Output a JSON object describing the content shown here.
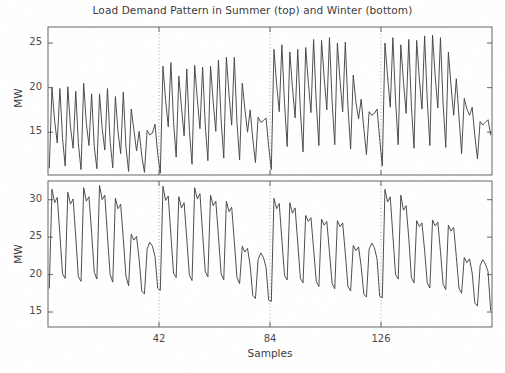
{
  "chart_data": {
    "type": "line",
    "title": "Load Demand Pattern in Summer (top) and Winter (bottom)",
    "xlabel": "Samples",
    "subplots": [
      {
        "name": "summer",
        "ylabel": "MW",
        "yticks": [
          15,
          20,
          25
        ],
        "ylim": [
          10.2,
          26.8
        ],
        "xlim": [
          0,
          168
        ],
        "xticks": [
          42,
          84,
          126
        ],
        "grid": false,
        "vlines": [
          42,
          84,
          126
        ],
        "line_color": "#444444",
        "values": [
          11.0,
          20.0,
          16.3,
          13.8,
          19.9,
          14.3,
          11.2,
          20.1,
          15.6,
          13.2,
          19.6,
          13.7,
          10.8,
          20.5,
          16.0,
          13.5,
          19.3,
          13.4,
          10.9,
          19.3,
          15.4,
          13.0,
          19.9,
          14.0,
          11.0,
          19.0,
          15.0,
          12.6,
          19.5,
          13.3,
          10.6,
          17.6,
          15.3,
          12.9,
          15.1,
          12.3,
          10.5,
          15.2,
          14.7,
          14.9,
          15.9,
          12.6,
          10.4,
          22.4,
          18.6,
          15.6,
          22.8,
          16.2,
          12.2,
          21.3,
          17.8,
          14.6,
          22.1,
          15.2,
          11.4,
          22.5,
          18.7,
          15.4,
          22.3,
          15.8,
          11.8,
          22.4,
          18.4,
          15.1,
          23.1,
          16.4,
          12.1,
          23.4,
          19.2,
          15.8,
          23.4,
          16.1,
          11.9,
          20.5,
          17.6,
          15.0,
          17.5,
          14.2,
          11.6,
          16.7,
          16.1,
          16.3,
          16.6,
          13.4,
          10.8,
          24.3,
          20.4,
          17.3,
          24.8,
          18.2,
          13.4,
          24.0,
          20.0,
          16.6,
          24.3,
          17.4,
          12.8,
          24.5,
          20.6,
          17.2,
          25.4,
          18.3,
          13.5,
          25.3,
          21.1,
          17.5,
          25.6,
          18.4,
          13.6,
          25.0,
          20.8,
          17.3,
          25.1,
          17.9,
          13.1,
          21.4,
          18.4,
          16.5,
          18.7,
          15.4,
          12.5,
          17.3,
          16.9,
          17.1,
          17.6,
          14.3,
          11.2,
          25.0,
          21.2,
          17.8,
          25.6,
          18.6,
          13.6,
          24.8,
          20.7,
          17.1,
          25.4,
          18.0,
          13.2,
          25.3,
          21.0,
          17.6,
          25.8,
          18.6,
          13.5,
          25.9,
          21.3,
          17.7,
          25.6,
          18.2,
          13.3,
          24.0,
          20.2,
          16.9,
          21.0,
          16.8,
          12.6,
          18.8,
          17.6,
          16.9,
          17.8,
          14.6,
          12.0,
          16.2,
          15.8,
          16.1,
          16.4,
          14.7
        ]
      },
      {
        "name": "winter",
        "ylabel": "MW",
        "yticks": [
          15,
          20,
          25,
          30
        ],
        "ylim": [
          13.0,
          32.5
        ],
        "xlim": [
          0,
          168
        ],
        "xticks": [
          42,
          84,
          126
        ],
        "grid": false,
        "vlines": [
          42,
          84,
          126
        ],
        "line_color": "#444444",
        "values": [
          18.2,
          31.4,
          29.6,
          30.3,
          25.4,
          20.1,
          19.5,
          31.0,
          29.4,
          30.1,
          25.0,
          19.7,
          19.1,
          31.6,
          29.8,
          30.4,
          25.6,
          20.3,
          19.4,
          31.9,
          30.0,
          30.6,
          25.2,
          20.0,
          19.0,
          30.2,
          28.8,
          29.4,
          24.7,
          19.8,
          18.5,
          25.4,
          24.6,
          25.1,
          22.0,
          17.8,
          17.4,
          23.4,
          24.3,
          23.8,
          22.4,
          18.2,
          17.9,
          31.8,
          29.9,
          30.5,
          25.3,
          20.2,
          19.6,
          30.4,
          28.9,
          29.6,
          24.8,
          19.9,
          19.2,
          31.6,
          30.1,
          30.8,
          25.5,
          20.4,
          19.7,
          30.6,
          29.2,
          29.8,
          25.1,
          20.1,
          19.3,
          29.8,
          28.4,
          29.0,
          24.4,
          19.6,
          18.8,
          23.8,
          23.0,
          23.5,
          21.2,
          17.2,
          16.8,
          22.0,
          22.9,
          22.3,
          21.0,
          16.6,
          16.4,
          30.2,
          28.8,
          29.5,
          24.6,
          19.9,
          19.3,
          29.6,
          28.2,
          28.9,
          24.2,
          19.5,
          18.9,
          27.9,
          27.1,
          27.6,
          23.4,
          19.1,
          18.4,
          27.4,
          26.6,
          27.1,
          23.0,
          18.8,
          18.1,
          27.2,
          26.4,
          26.9,
          22.8,
          18.4,
          17.8,
          23.9,
          23.2,
          23.7,
          21.1,
          17.4,
          17.0,
          23.4,
          24.2,
          23.6,
          22.1,
          17.1,
          16.9,
          31.4,
          29.7,
          30.4,
          25.2,
          20.0,
          19.4,
          30.6,
          28.6,
          29.2,
          24.9,
          19.6,
          18.9,
          27.2,
          26.4,
          26.9,
          23.2,
          18.9,
          18.2,
          27.3,
          26.5,
          27.0,
          23.1,
          18.7,
          18.0,
          26.6,
          25.8,
          26.3,
          22.4,
          18.2,
          17.5,
          22.3,
          21.6,
          22.1,
          20.2,
          16.2,
          15.8,
          21.2,
          22.0,
          21.4,
          20.4,
          15.2
        ]
      }
    ]
  },
  "axes": {
    "top": {
      "ytick_labels": [
        "25",
        "20",
        "15"
      ],
      "xtick_labels": []
    },
    "bottom": {
      "ytick_labels": [
        "30",
        "25",
        "20",
        "15"
      ],
      "xtick_labels": [
        "42",
        "84",
        "126"
      ]
    }
  }
}
